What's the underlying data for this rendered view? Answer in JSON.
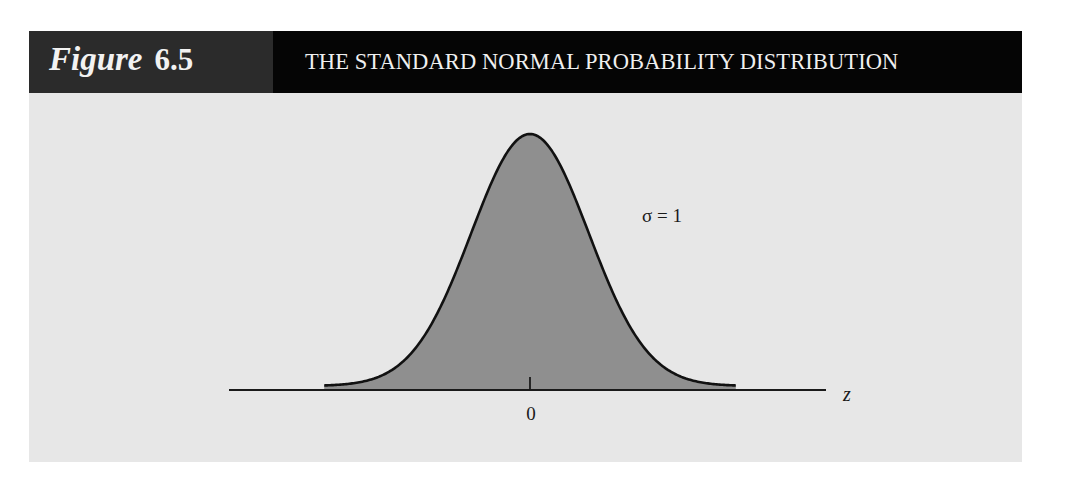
{
  "figure": {
    "label_word": "Figure",
    "label_number": "6.5",
    "title": "THE STANDARD NORMAL PROBABILITY DISTRIBUTION"
  },
  "colors": {
    "header_left": "#2b2b2b",
    "header_right": "#050505",
    "panel_background": "#e7e7e7",
    "curve_fill": "#8f8f8f",
    "curve_stroke": "#111111",
    "axis": "#1a1a1a"
  },
  "chart_data": {
    "type": "area",
    "title": "THE STANDARD NORMAL PROBABILITY DISTRIBUTION",
    "distribution": "standard normal",
    "mean": 0,
    "std": 1,
    "xlabel": "z",
    "ylabel": "",
    "x_ticks": [
      0
    ],
    "x_tick_labels": [
      "0"
    ],
    "annotations": [
      "σ = 1"
    ],
    "x_range_drawn": [
      -3.5,
      3.5
    ],
    "grid": false,
    "legend": "none",
    "shaded_region": "entire area under curve",
    "sample_points": {
      "x": [
        -3.5,
        -3,
        -2.5,
        -2,
        -1.5,
        -1,
        -0.5,
        0,
        0.5,
        1,
        1.5,
        2,
        2.5,
        3,
        3.5
      ],
      "y": [
        0.0009,
        0.0044,
        0.0175,
        0.054,
        0.1295,
        0.242,
        0.3521,
        0.3989,
        0.3521,
        0.242,
        0.1295,
        0.054,
        0.0175,
        0.0044,
        0.0009
      ]
    }
  },
  "labels": {
    "sigma": "σ = 1",
    "tick_zero": "0",
    "axis_z": "z"
  }
}
